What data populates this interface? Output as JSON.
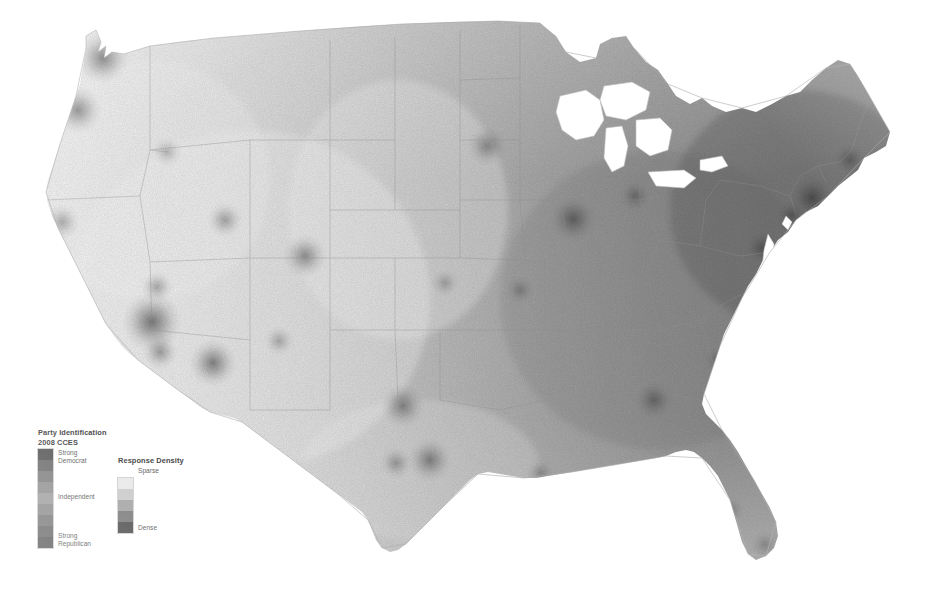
{
  "figure": {
    "kind": "map",
    "background_color": "#ffffff"
  },
  "map": {
    "name": "contiguous-united-states",
    "projection_look": "albers-usa",
    "state_border_color": "#9a9a9a",
    "coast_outline_color": "#b4b4b4",
    "fill_light": "#f3f3f3",
    "fill_mid": "#9c9c9c",
    "fill_dark": "#5a5a5a",
    "hotspots": [
      {
        "name": "seattle",
        "x": 103,
        "y": 58,
        "r": 26,
        "intensity": 0.55
      },
      {
        "name": "portland",
        "x": 78,
        "y": 110,
        "r": 24,
        "intensity": 0.48
      },
      {
        "name": "bay-area",
        "x": 40,
        "y": 243,
        "r": 26,
        "intensity": 0.5
      },
      {
        "name": "sacramento",
        "x": 62,
        "y": 222,
        "r": 18,
        "intensity": 0.34
      },
      {
        "name": "los-angeles",
        "x": 152,
        "y": 322,
        "r": 30,
        "intensity": 0.6
      },
      {
        "name": "san-diego",
        "x": 160,
        "y": 352,
        "r": 18,
        "intensity": 0.4
      },
      {
        "name": "las-vegas",
        "x": 157,
        "y": 287,
        "r": 16,
        "intensity": 0.34
      },
      {
        "name": "phoenix",
        "x": 213,
        "y": 363,
        "r": 24,
        "intensity": 0.54
      },
      {
        "name": "salt-lake-city",
        "x": 225,
        "y": 220,
        "r": 18,
        "intensity": 0.36
      },
      {
        "name": "denver",
        "x": 305,
        "y": 256,
        "r": 22,
        "intensity": 0.46
      },
      {
        "name": "albuquerque",
        "x": 279,
        "y": 341,
        "r": 15,
        "intensity": 0.3
      },
      {
        "name": "boise",
        "x": 167,
        "y": 152,
        "r": 15,
        "intensity": 0.26
      },
      {
        "name": "minneapolis",
        "x": 487,
        "y": 146,
        "r": 20,
        "intensity": 0.4
      },
      {
        "name": "chicago",
        "x": 573,
        "y": 219,
        "r": 24,
        "intensity": 0.52
      },
      {
        "name": "dallas",
        "x": 403,
        "y": 406,
        "r": 22,
        "intensity": 0.46
      },
      {
        "name": "houston",
        "x": 430,
        "y": 460,
        "r": 22,
        "intensity": 0.48
      },
      {
        "name": "san-antonio",
        "x": 396,
        "y": 463,
        "r": 16,
        "intensity": 0.34
      },
      {
        "name": "new-orleans",
        "x": 540,
        "y": 473,
        "r": 14,
        "intensity": 0.3
      },
      {
        "name": "atlanta",
        "x": 654,
        "y": 400,
        "r": 20,
        "intensity": 0.42
      },
      {
        "name": "miami",
        "x": 765,
        "y": 545,
        "r": 15,
        "intensity": 0.36
      },
      {
        "name": "tampa",
        "x": 731,
        "y": 510,
        "r": 14,
        "intensity": 0.3
      },
      {
        "name": "new-york",
        "x": 812,
        "y": 198,
        "r": 24,
        "intensity": 0.58
      },
      {
        "name": "boston",
        "x": 850,
        "y": 160,
        "r": 18,
        "intensity": 0.46
      },
      {
        "name": "philadelphia",
        "x": 792,
        "y": 215,
        "r": 16,
        "intensity": 0.42
      },
      {
        "name": "washington-dc",
        "x": 762,
        "y": 248,
        "r": 18,
        "intensity": 0.44
      },
      {
        "name": "detroit",
        "x": 635,
        "y": 196,
        "r": 16,
        "intensity": 0.36
      },
      {
        "name": "kansas-city",
        "x": 445,
        "y": 283,
        "r": 14,
        "intensity": 0.28
      },
      {
        "name": "st-louis",
        "x": 520,
        "y": 290,
        "r": 15,
        "intensity": 0.3
      },
      {
        "name": "charlotte",
        "x": 718,
        "y": 360,
        "r": 14,
        "intensity": 0.3
      }
    ]
  },
  "legends": {
    "party": {
      "title": "Party Identification",
      "subtitle": "2008 CCES",
      "labels": {
        "top_line1": "Strong",
        "top_line2": "Democrat",
        "middle": "Independent",
        "bottom_line1": "Strong",
        "bottom_line2": "Republican"
      },
      "swatch_colors": [
        "#555555",
        "#6b6b6b",
        "#7e7e7e",
        "#8f8f8f",
        "#9e9e9e",
        "#8c8c8c",
        "#7a7a7a",
        "#6a6a6a",
        "#5c5c5c"
      ]
    },
    "density": {
      "title": "Response Density",
      "labels": {
        "top": "Sparse",
        "bottom": "Dense"
      },
      "swatch_colors": [
        "#e8e8e8",
        "#c9c9c9",
        "#a3a3a3",
        "#7a7a7a",
        "#4f4f4f"
      ]
    }
  }
}
